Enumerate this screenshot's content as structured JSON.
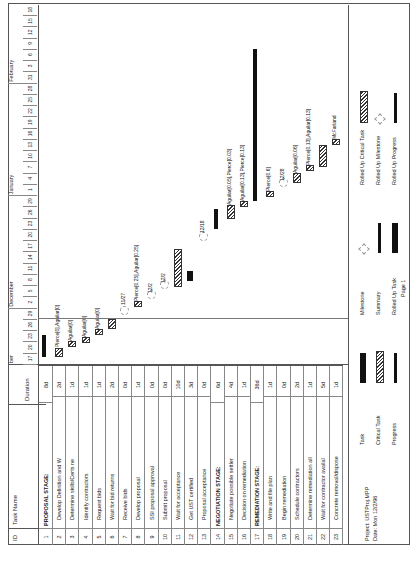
{
  "table": {
    "headers": {
      "id": "ID",
      "name": "Task Name",
      "duration": "Duration"
    },
    "rows": [
      {
        "id": "1",
        "name": "PROPOSAL STAGE:",
        "duration": "8d",
        "summary": true
      },
      {
        "id": "2",
        "name": "Develop Definition and W",
        "duration": "2d"
      },
      {
        "id": "3",
        "name": "Determine skills/Certs ne",
        "duration": "1d"
      },
      {
        "id": "4",
        "name": "Identify contractors",
        "duration": "1d"
      },
      {
        "id": "5",
        "name": "Request bids",
        "duration": "1d"
      },
      {
        "id": "6",
        "name": "Wait for bid returns",
        "duration": "2d"
      },
      {
        "id": "7",
        "name": "Receive bids",
        "duration": "0d"
      },
      {
        "id": "8",
        "name": "Develop proposal",
        "duration": "1d"
      },
      {
        "id": "9",
        "name": "SSI proposal approval",
        "duration": "0d"
      },
      {
        "id": "10",
        "name": "Submit proposal",
        "duration": "0d"
      },
      {
        "id": "11",
        "name": "Wait for acceptance",
        "duration": "10d"
      },
      {
        "id": "12",
        "name": "Get UST certified",
        "duration": "3d"
      },
      {
        "id": "13",
        "name": "Proposal acceptance",
        "duration": "0d"
      },
      {
        "id": "14",
        "name": "NEGOTIATION STAGE:",
        "duration": "6d",
        "summary": true
      },
      {
        "id": "15",
        "name": "Negotiate possible settler",
        "duration": "4d"
      },
      {
        "id": "16",
        "name": "Decision on remediation",
        "duration": "1d"
      },
      {
        "id": "17",
        "name": "REMEDIATION STAGE:",
        "duration": "36d",
        "summary": true
      },
      {
        "id": "18",
        "name": "Write and file plan",
        "duration": "1d"
      },
      {
        "id": "19",
        "name": "Begin remediation",
        "duration": "0d"
      },
      {
        "id": "20",
        "name": "Schedule contractors",
        "duration": "2d"
      },
      {
        "id": "21",
        "name": "Determine remediation all",
        "duration": "1d"
      },
      {
        "id": "22",
        "name": "Wait for contractor availal",
        "duration": "5d"
      },
      {
        "id": "23",
        "name": "Concrete removal/dispose",
        "duration": "1d"
      }
    ]
  },
  "timescale": {
    "months": [
      {
        "label": "ber",
        "day_index": 0
      },
      {
        "label": "December",
        "day_index": 5
      },
      {
        "label": "January",
        "day_index": 15
      },
      {
        "label": "February",
        "day_index": 25
      }
    ],
    "days": [
      "17",
      "20",
      "23",
      "26",
      "29",
      "2",
      "5",
      "8",
      "11",
      "14",
      "17",
      "20",
      "23",
      "26",
      "29",
      "1",
      "4",
      "7",
      "10",
      "13",
      "16",
      "19",
      "22",
      "25",
      "28",
      "31",
      "3",
      "6",
      "9",
      "12",
      "15",
      "18"
    ]
  },
  "bars": {
    "labels": [
      {
        "row": 2,
        "text": "Pierce[0],Aguilar[0]"
      },
      {
        "row": 3,
        "text": "Aguilar[0]"
      },
      {
        "row": 4,
        "text": "Aguilar[0]"
      },
      {
        "row": 5,
        "text": "Aguilar[0]"
      },
      {
        "row": 7,
        "text": "11/27"
      },
      {
        "row": 8,
        "text": "Pierce[0.25],Aguilar[0.25]"
      },
      {
        "row": 9,
        "text": "12/2"
      },
      {
        "row": 10,
        "text": "12/2"
      },
      {
        "row": 13,
        "text": "12/18"
      },
      {
        "row": 15,
        "text": "Aguilar[0.05],Pierce[0.03]"
      },
      {
        "row": 16,
        "text": "Aguilar[0.13],Pierce[0.13]"
      },
      {
        "row": 18,
        "text": "Pierce[0.6]"
      },
      {
        "row": 19,
        "text": "12/28"
      },
      {
        "row": 20,
        "text": "Aguilar[0.06]"
      },
      {
        "row": 21,
        "text": "Pierce[0.13],Aguilar[0.13]"
      },
      {
        "row": 23,
        "text": "McFarland"
      }
    ]
  },
  "legend": {
    "project": "Project: USTProj.MPP",
    "date": "Date: Mon 12/2/96",
    "items": [
      {
        "label": "Task",
        "kind": "task"
      },
      {
        "label": "Critical Task",
        "kind": "crit"
      },
      {
        "label": "Progress",
        "kind": "progress"
      },
      {
        "label": "Milestone",
        "kind": "milestone"
      },
      {
        "label": "Summary",
        "kind": "summary"
      },
      {
        "label": "Rolled Up Task",
        "kind": "rolled-task"
      },
      {
        "label": "Rolled Up Critical Task",
        "kind": "rolled-crit"
      },
      {
        "label": "Rolled Up Milestone",
        "kind": "rolled-milestone"
      },
      {
        "label": "Rolled Up Progress",
        "kind": "rolled-progress"
      }
    ]
  },
  "footer": {
    "page": "Page 1"
  }
}
